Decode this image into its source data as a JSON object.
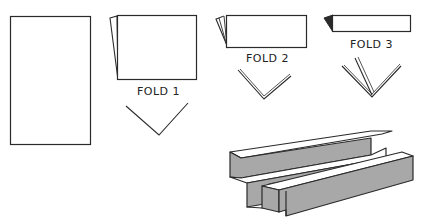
{
  "diagram": {
    "type": "paper-folding-instructions",
    "steps": [
      {
        "id": "sheet",
        "label": ""
      },
      {
        "id": "fold1",
        "label": "FOLD 1"
      },
      {
        "id": "fold2",
        "label": "FOLD 2"
      },
      {
        "id": "fold3",
        "label": "FOLD 3"
      },
      {
        "id": "result",
        "label": ""
      }
    ]
  },
  "colors": {
    "stroke": "#2a2a2a",
    "shade": "#a8a8a8",
    "background": "#ffffff"
  }
}
